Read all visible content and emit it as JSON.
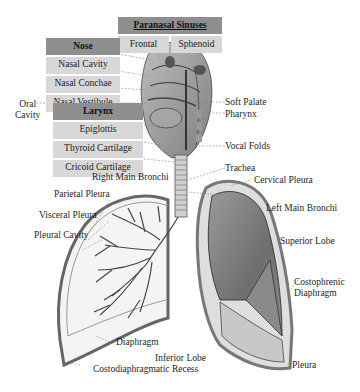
{
  "diagram": {
    "tables": {
      "paranasal_sinuses": {
        "header": "Paranasal Sinuses",
        "cells": [
          "Frontal",
          "Sphenoid"
        ]
      },
      "nose": {
        "header": "Nose",
        "cells": [
          "Nasal Cavity",
          "Nasal Conchae",
          "Nasal Vestibule"
        ]
      },
      "larynx": {
        "header": "Larynx",
        "cells": [
          "Epiglottis",
          "Thyroid Cartilage",
          "Cricoid Cartilage"
        ]
      }
    },
    "labels": {
      "oral_cavity": "Oral\nCavity",
      "oral_line1": "Oral",
      "oral_line2": "Cavity",
      "soft_palate": "Soft Palate",
      "pharynx": "Pharynx",
      "vocal_folds": "Vocal Folds",
      "trachea": "Trachea",
      "right_main_bronchi": "Right Main Bronchi",
      "cervical_pleura": "Cervical Pleura",
      "parietal_pleura": "Parietal Pleura",
      "left_main_bronchi": "Left Main Bronchi",
      "visceral_pleura": "Visceral Pleura",
      "pleural_cavity": "Pleural Cavity",
      "superior_lobe": "Superior Lobe",
      "costophrenic_line1": "Costophrenic",
      "costophrenic_line2": "Diaphragm",
      "diaphragm": "Diaphragm",
      "inferior_lobe": "Inferior Lobe",
      "costodiaphragmatic_recess": "Costodiaphragmatic Recess",
      "pleura": "Pleura"
    },
    "colors": {
      "header_bg": "#8f8f8f",
      "cell_bg": "#d8d8d8",
      "lung_dark": "#7a7a7a",
      "lung_light": "#e8e8e8"
    }
  }
}
